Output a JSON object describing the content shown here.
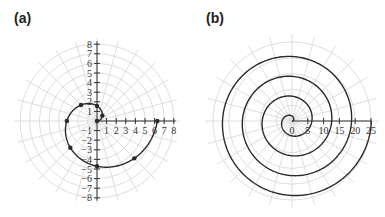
{
  "figure": {
    "panels": [
      {
        "label": "(a)"
      },
      {
        "label": "(b)"
      }
    ]
  },
  "colors": {
    "grid": "#d9d9d9",
    "axis": "#333333",
    "curve": "#2a2a2a",
    "background": "#ffffff"
  },
  "chart_data": [
    {
      "panel": "(a)",
      "type": "line",
      "coordinate_system": "polar",
      "title": "",
      "inferred_curve": "r = θ (Archimedean spiral) — inferred from shape; not labeled in figure",
      "theta_range": [
        0,
        6.2832
      ],
      "x_ticks": [
        "1",
        "2",
        "3",
        "4",
        "5",
        "6",
        "7",
        "8"
      ],
      "y_ticks": [
        "8",
        "7",
        "6",
        "5",
        "4",
        "3",
        "2",
        "1",
        "-1",
        "-2",
        "-3",
        "-4",
        "-5",
        "-6",
        "-7",
        "-8"
      ],
      "xlim": [
        0,
        8
      ],
      "ylim": [
        -8,
        8
      ],
      "grid": "polar: concentric circles at r = 1..8, radial lines every 15°",
      "marked_points_polar": [
        {
          "theta": 0,
          "r": 0
        },
        {
          "theta": 0.7854,
          "r": 0.79
        },
        {
          "theta": 1.5708,
          "r": 1.57
        },
        {
          "theta": 2.3562,
          "r": 2.36
        },
        {
          "theta": 3.1416,
          "r": 3.14
        },
        {
          "theta": 3.927,
          "r": 3.93
        },
        {
          "theta": 4.7124,
          "r": 4.71
        },
        {
          "theta": 5.4978,
          "r": 5.5
        },
        {
          "theta": 6.2832,
          "r": 6.28
        }
      ],
      "marked_points_xy": [
        {
          "x": 0,
          "y": 0
        },
        {
          "x": 0.56,
          "y": 0.56
        },
        {
          "x": 0,
          "y": 1.57
        },
        {
          "x": -1.67,
          "y": 1.67
        },
        {
          "x": -3.14,
          "y": 0
        },
        {
          "x": -2.78,
          "y": -2.78
        },
        {
          "x": 0,
          "y": -4.71
        },
        {
          "x": 3.89,
          "y": -3.89
        },
        {
          "x": 6.28,
          "y": 0
        }
      ]
    },
    {
      "panel": "(b)",
      "type": "line",
      "coordinate_system": "polar",
      "title": "",
      "inferred_curve": "r = θ (Archimedean spiral) — inferred from shape; not labeled in figure",
      "theta_range": [
        0,
        25.13
      ],
      "x_ticks": [
        "0",
        "5",
        "10",
        "15",
        "20",
        "25"
      ],
      "xlim": [
        0,
        25
      ],
      "grid": "polar: concentric circles every 5 units up to 25, radial lines every 15°",
      "turns": 4,
      "endpoint_xy": {
        "x": 25.13,
        "y": 0
      }
    }
  ]
}
